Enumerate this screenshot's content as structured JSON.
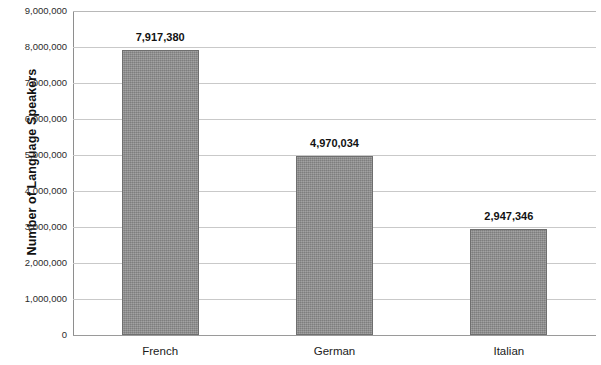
{
  "chart_data": {
    "type": "bar",
    "title": "",
    "subtitle": "",
    "xlabel": "",
    "ylabel": "Number of Language Speakers",
    "categories": [
      "French",
      "German",
      "Italian"
    ],
    "values": [
      7917380,
      4970034,
      2947346
    ],
    "value_labels": [
      "7,917,380",
      "4,970,034",
      "2,947,346"
    ],
    "ylim": [
      0,
      9000000
    ],
    "ytick_values": [
      0,
      1000000,
      2000000,
      3000000,
      4000000,
      5000000,
      6000000,
      7000000,
      8000000,
      9000000
    ],
    "ytick_labels": [
      "0",
      "1,000,000",
      "2,000,000",
      "3,000,000",
      "4,000,000",
      "5,000,000",
      "6,000,000",
      "7,000,000",
      "8,000,000",
      "9,000,000"
    ],
    "grid": true,
    "grid_axis": "y",
    "legend": false,
    "legend_position": "none",
    "series": [
      {
        "name": "Number of Language Speakers",
        "values": [
          7917380,
          4970034,
          2947346
        ],
        "color": "#8d8d8d"
      }
    ],
    "colors": {
      "bar_fill": "#8d8d8d",
      "bar_border": "#6f6f6f",
      "gridline": "#c9c9c9",
      "axis_line": "#8e8e8e",
      "text": "#1a1a1a",
      "background": "#ffffff"
    }
  }
}
